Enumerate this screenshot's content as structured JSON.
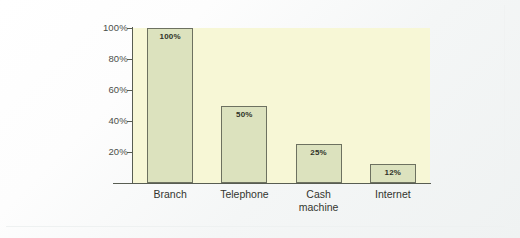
{
  "chart_data": {
    "type": "bar",
    "title": "",
    "subtitle": "",
    "xlabel": "",
    "ylabel": "",
    "categories": [
      "Branch",
      "Telephone",
      "Cash machine",
      "Internet"
    ],
    "category_lines": [
      [
        "Branch"
      ],
      [
        "Telephone"
      ],
      [
        "Cash",
        "machine"
      ],
      [
        "Internet"
      ]
    ],
    "values": [
      100,
      50,
      25,
      12
    ],
    "value_labels": [
      "100%",
      "50%",
      "25%",
      "12%"
    ],
    "ylim": [
      0,
      100
    ],
    "y_ticks": [
      100,
      80,
      60,
      40,
      20
    ],
    "y_tick_labels": [
      "100%",
      "80%",
      "60%",
      "40%",
      "20%"
    ],
    "grid": false,
    "legend": false,
    "legend_position": "none",
    "data_labels_inside_bars": true,
    "colors": {
      "bar_fill": "#DCE2BE",
      "bar_border": "#6D7160",
      "plot_background": "#F7F7D6",
      "axis_line": "#585D52",
      "tick_text": "#4C4F4A",
      "category_text": "#33352F",
      "value_text": "#2F3228",
      "canvas_background": "#FFFFFF"
    }
  }
}
